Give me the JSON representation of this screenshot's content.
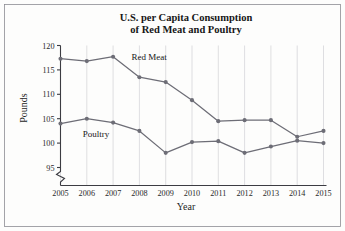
{
  "chart_data": {
    "type": "line",
    "title_line1": "U.S. per Capita Consumption",
    "title_line2": "of Red Meat and Poultry",
    "xlabel": "Year",
    "ylabel": "Pounds",
    "x": [
      2005,
      2006,
      2007,
      2008,
      2009,
      2010,
      2011,
      2012,
      2013,
      2014,
      2015
    ],
    "categories": [
      "2005",
      "2006",
      "2007",
      "2008",
      "2009",
      "2010",
      "2011",
      "2012",
      "2013",
      "2014",
      "2015"
    ],
    "xtick_labels": [
      "2005",
      "2006",
      "2007",
      "2008",
      "2009",
      "2010",
      "2011",
      "2012",
      "2013",
      "2014",
      "2015"
    ],
    "ytick_labels": [
      "95",
      "100",
      "105",
      "110",
      "115",
      "120"
    ],
    "ytick_values": [
      95,
      100,
      105,
      110,
      115,
      120
    ],
    "ylim": [
      93.2,
      120
    ],
    "xlim": [
      2005,
      2015
    ],
    "y_axis_break": true,
    "y_axis_break_note": "zigzag break below 95",
    "grid": "vertical",
    "legend_position": "inline-annotation",
    "series": [
      {
        "name": "Red Meat",
        "label": "Red Meat",
        "color": "#6d6d76",
        "marker": "circle",
        "values": [
          117.3,
          116.8,
          117.7,
          113.5,
          112.5,
          108.8,
          104.5,
          104.7,
          104.7,
          101.3,
          102.5
        ]
      },
      {
        "name": "Poultry",
        "label": "Poultry",
        "color": "#6d6d76",
        "marker": "circle",
        "values": [
          104.0,
          105.0,
          104.2,
          102.5,
          98.0,
          100.2,
          100.4,
          98.0,
          99.3,
          100.5,
          100.0
        ]
      }
    ],
    "annotations": [
      {
        "text": "Red Meat",
        "x": 2007.7,
        "y": 117.0
      },
      {
        "text": "Poultry",
        "x": 2005.85,
        "y": 101.3
      }
    ]
  },
  "colors": {
    "line": "#6d6d76",
    "grid": "#c9c9cf",
    "axis": "#3c3c42",
    "text": "#161616",
    "background": "#fdfdfc",
    "frame": "#8d8d93"
  }
}
